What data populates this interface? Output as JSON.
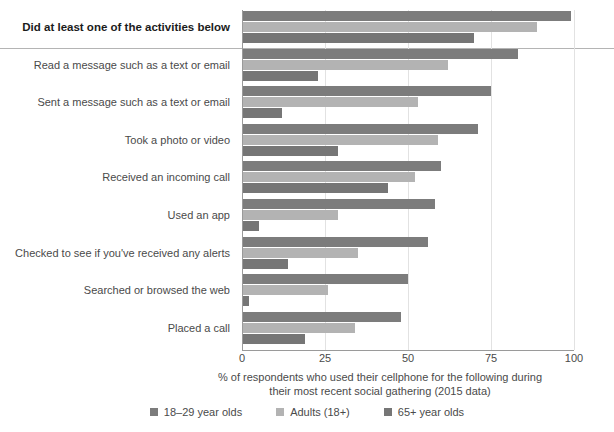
{
  "chart_data": {
    "type": "bar",
    "orientation": "horizontal",
    "title": "",
    "xlabel": "% of respondents who used their cellphone for the following during their most recent social gathering (2015 data)",
    "xlabel_lines": [
      "% of respondents who used their cellphone for the following during",
      "their most recent social gathering (2015 data)"
    ],
    "ylabel": "",
    "xlim": [
      0,
      100
    ],
    "xticks": [
      0,
      25,
      50,
      75,
      100
    ],
    "xtick_labels": [
      "0",
      "25",
      "50",
      "75",
      "100"
    ],
    "grid": true,
    "grid_axis": "x",
    "legend_position": "bottom",
    "categories": [
      "Did at least one of the activities below",
      "Read a message such as a text or email",
      "Sent a message such as a text or email",
      "Took a photo or video",
      "Received an incoming call",
      "Used an app",
      "Checked to see if you've received any alerts",
      "Searched or browsed the web",
      "Placed a call"
    ],
    "highlight_category_index": 0,
    "series": [
      {
        "name": "18–29 year olds",
        "color": "#7c7c7c",
        "values": [
          99,
          83,
          75,
          71,
          60,
          58,
          56,
          50,
          48
        ]
      },
      {
        "name": "Adults (18+)",
        "color": "#b3b3b3",
        "values": [
          89,
          62,
          53,
          59,
          52,
          29,
          35,
          26,
          34
        ]
      },
      {
        "name": "65+ year olds",
        "color": "#767676",
        "values": [
          70,
          23,
          12,
          29,
          44,
          5,
          14,
          2,
          19
        ]
      }
    ]
  }
}
